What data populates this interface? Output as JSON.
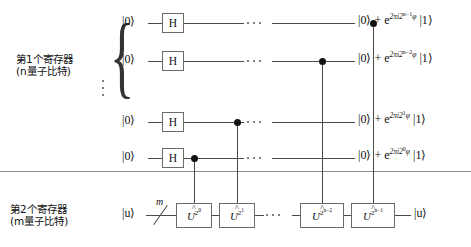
{
  "diagram": {
    "registers": [
      {
        "name": "第1个寄存器",
        "qubits_note": "(n量子比特)",
        "brace": "{"
      },
      {
        "name": "第2个寄存器",
        "qubits_note": "(m量子比特)"
      }
    ],
    "top_wires": [
      {
        "input_ket": "|0⟩",
        "gate": "H",
        "output_prefix": "|0⟩ + e",
        "output_exp_base": "2πi2",
        "output_exp_sup": "n−1",
        "output_phase": "φ",
        "output_suffix": "|1⟩"
      },
      {
        "input_ket": "|0⟩",
        "gate": "H",
        "output_prefix": "|0⟩ + e",
        "output_exp_base": "2πi2",
        "output_exp_sup": "n−2",
        "output_phase": "φ",
        "output_suffix": "|1⟩"
      },
      {
        "input_ket": "|0⟩",
        "gate": "H",
        "output_prefix": "|0⟩ + e",
        "output_exp_base": "2πi2",
        "output_exp_sup": "1",
        "output_phase": "φ",
        "output_suffix": "|1⟩"
      },
      {
        "input_ket": "|0⟩",
        "gate": "H",
        "output_prefix": "|0⟩ + e",
        "output_exp_base": "2πi2",
        "output_exp_sup": "0",
        "output_phase": "φ",
        "output_suffix": "|1⟩"
      }
    ],
    "bottom_wire": {
      "input_ket": "|u⟩",
      "bus_label": "m",
      "output_ket": "|u⟩"
    },
    "u_gates": [
      {
        "symbol": "U",
        "exp_base": "2",
        "exp_sup": "0"
      },
      {
        "symbol": "U",
        "exp_base": "2",
        "exp_sup": "1"
      },
      {
        "symbol": "U",
        "exp_base": "2",
        "exp_sup": "n−2"
      },
      {
        "symbol": "U",
        "exp_base": "2",
        "exp_sup": "n−1"
      }
    ],
    "ellipsis": {
      "horizontal": "⋯",
      "vertical": "⋮"
    },
    "colors": {
      "wire": "#4a4a4a",
      "gate_border": "#6b6b6b",
      "control_dot": "#111111",
      "separator": "#8a8a8a",
      "text": "#111111",
      "background": "#ffffff"
    }
  }
}
